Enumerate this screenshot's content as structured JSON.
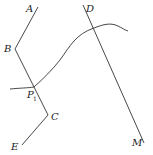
{
  "diagram": {
    "type": "geometry-construction",
    "labels": {
      "A": "A",
      "B": "B",
      "C": "C",
      "D": "D",
      "E": "E",
      "M": "M",
      "P": "P",
      "P_sub": "1"
    },
    "polyline_ABCE": "A → B → C → E (broken line)",
    "line_DM": "straight line from D to M",
    "curve": "curve crossing line at P1 and line DM",
    "stroke_color": "#333333"
  }
}
